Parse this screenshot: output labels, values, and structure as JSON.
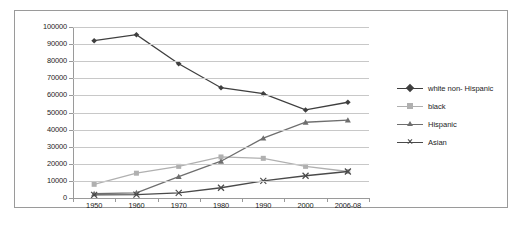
{
  "chart_data": {
    "type": "line",
    "title": "",
    "xlabel": "",
    "ylabel": "",
    "categories": [
      "1950",
      "1960",
      "1970",
      "1980",
      "1990",
      "2000",
      "2006-08"
    ],
    "ylim": [
      0,
      100000
    ],
    "y_ticks": [
      "0",
      "10000",
      "20000",
      "30000",
      "40000",
      "50000",
      "60000",
      "70000",
      "80000",
      "90000",
      "100000"
    ],
    "grid": true,
    "legend_position": "right",
    "series": [
      {
        "name": "white non- Hispanic",
        "marker": "diamond",
        "color": "#3f3f3f",
        "values": [
          92000,
          95500,
          78500,
          64500,
          61000,
          51500,
          56000
        ]
      },
      {
        "name": "black",
        "marker": "square",
        "color": "#b0b0b0",
        "values": [
          8000,
          14500,
          18500,
          24000,
          23200,
          18500,
          15500
        ]
      },
      {
        "name": "Hispanic",
        "marker": "triangle",
        "color": "#6e6e6e",
        "values": [
          2500,
          3000,
          12500,
          21500,
          35000,
          44300,
          45500
        ]
      },
      {
        "name": "Asian",
        "marker": "cross",
        "color": "#4a4a4a",
        "values": [
          1800,
          2000,
          3000,
          6000,
          10000,
          13000,
          15500
        ]
      }
    ]
  },
  "legend": {
    "items": [
      {
        "label": "white non- Hispanic"
      },
      {
        "label": "black"
      },
      {
        "label": "Hispanic"
      },
      {
        "label": "Asian"
      }
    ]
  },
  "caption": {
    "text": ""
  }
}
